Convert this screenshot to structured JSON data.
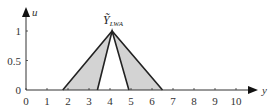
{
  "chart_data": {
    "type": "area",
    "title": "",
    "xlabel": "y",
    "ylabel": "u",
    "xlim": [
      0,
      10.5
    ],
    "ylim": [
      0,
      1.15
    ],
    "xticks": [
      0,
      1,
      2,
      3,
      4,
      5,
      6,
      7,
      8,
      9,
      10
    ],
    "yticks": [
      0,
      0.5,
      1
    ],
    "ytick_labels": [
      "0",
      "0.5",
      "1"
    ],
    "xtick_labels": [
      "0",
      "1",
      "2",
      "3",
      "4",
      "5",
      "6",
      "7",
      "8",
      "9",
      "10"
    ],
    "grid": false,
    "legend": null,
    "annotations": [
      {
        "text": "Ỹ",
        "subscript": "LWA",
        "x": 4.1,
        "y": 1.0,
        "position": "above apex"
      }
    ],
    "series": [
      {
        "name": "UMF",
        "description": "Upper membership function (outer triangle)",
        "points": [
          [
            1.75,
            0
          ],
          [
            4.1,
            1
          ],
          [
            6.5,
            0
          ]
        ]
      },
      {
        "name": "LMF",
        "description": "Lower membership function (inner triangle)",
        "points": [
          [
            3.4,
            0
          ],
          [
            4.1,
            1
          ],
          [
            4.9,
            0
          ]
        ]
      }
    ],
    "fill": {
      "region": "between UMF and LMF (footprint of uncertainty)",
      "color": "#d3d3d3"
    },
    "colors": {
      "line": "#222222",
      "fill": "#d3d3d3",
      "axis": "#333333"
    }
  }
}
